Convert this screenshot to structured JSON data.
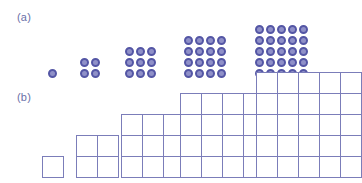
{
  "figure": {
    "background_color": "#ffffff"
  },
  "panels": [
    {
      "id": "a",
      "label": "(a)",
      "type": "dot-arrays",
      "dot_fill_color": "#8f90c8",
      "dot_stroke_color": "#5456a5"
    },
    {
      "id": "b",
      "label": "(b)",
      "type": "grid-squares",
      "line_color": "#7b7db9",
      "fill_color": "#ffffff"
    }
  ],
  "chart_data": {
    "type": "scatter",
    "xlabel": "",
    "ylabel": "",
    "categories": [
      "1",
      "2",
      "3",
      "4",
      "5"
    ],
    "values": [
      1,
      4,
      9,
      16,
      25
    ],
    "series": [
      {
        "name": "dot array count (a)",
        "values": [
          1,
          4,
          9,
          16,
          25
        ]
      },
      {
        "name": "grid cell count (b)",
        "values": [
          1,
          4,
          9,
          16,
          25
        ]
      }
    ],
    "grid": false,
    "legend_position": "none",
    "annotations": [
      "(a)",
      "(b)"
    ]
  },
  "dot_arrays": [
    {
      "name": "dot-array-1",
      "n": 1,
      "count": 1,
      "left": 48,
      "bottom": 78,
      "dot_size": 9,
      "gap": 2
    },
    {
      "name": "dot-array-2",
      "n": 2,
      "count": 4,
      "left": 80,
      "bottom": 78,
      "dot_size": 9,
      "gap": 2
    },
    {
      "name": "dot-array-3",
      "n": 3,
      "count": 9,
      "left": 125,
      "bottom": 78,
      "dot_size": 9,
      "gap": 2
    },
    {
      "name": "dot-array-4",
      "n": 4,
      "count": 16,
      "left": 184,
      "bottom": 78,
      "dot_size": 9,
      "gap": 2
    },
    {
      "name": "dot-array-5",
      "n": 5,
      "count": 25,
      "left": 255,
      "bottom": 78,
      "dot_size": 9,
      "gap": 2
    }
  ],
  "grid_squares": [
    {
      "name": "grid-square-1",
      "n": 1,
      "cells": 1,
      "left": 42,
      "bottom": 177,
      "cell_size": 21
    },
    {
      "name": "grid-square-2",
      "n": 2,
      "cells": 4,
      "left": 76,
      "bottom": 177,
      "cell_size": 21
    },
    {
      "name": "grid-square-3",
      "n": 3,
      "cells": 9,
      "left": 121,
      "bottom": 177,
      "cell_size": 21
    },
    {
      "name": "grid-square-4",
      "n": 4,
      "cells": 16,
      "left": 180,
      "bottom": 177,
      "cell_size": 21
    },
    {
      "name": "grid-square-5",
      "n": 5,
      "cells": 25,
      "left": 256,
      "bottom": 177,
      "cell_size": 21
    }
  ]
}
